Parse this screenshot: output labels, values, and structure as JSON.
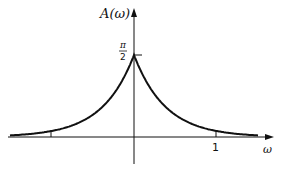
{
  "chart_data": {
    "type": "line",
    "title": "",
    "xlabel": "ω",
    "ylabel": "A(ω)",
    "function": "A(ω) = (π/2)·exp(-k|ω|) (symmetric decaying peak)",
    "y_ticks": [
      {
        "value": 1.5708,
        "label": "π/2"
      }
    ],
    "x_ticks": [
      {
        "value": -1,
        "label": ""
      },
      {
        "value": 0,
        "label": ""
      },
      {
        "value": 1,
        "label": "1"
      }
    ],
    "x": [
      -1.6,
      -1.2,
      -1.0,
      -0.8,
      -0.6,
      -0.4,
      -0.2,
      -0.1,
      0,
      0.1,
      0.2,
      0.4,
      0.6,
      0.8,
      1.0,
      1.2,
      1.6
    ],
    "values": [
      0.03,
      0.07,
      0.11,
      0.18,
      0.29,
      0.47,
      0.77,
      1.1,
      1.5708,
      1.1,
      0.77,
      0.47,
      0.29,
      0.18,
      0.11,
      0.07,
      0.03
    ],
    "grid": false,
    "legend": null
  },
  "labels": {
    "y_axis": "A(ω)",
    "y_tick_num": "π",
    "y_tick_den": "2",
    "x_tick_one": "1",
    "x_axis": "ω"
  }
}
